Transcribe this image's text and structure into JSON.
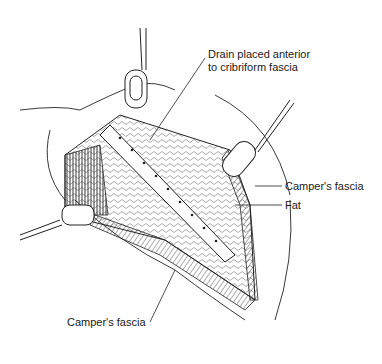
{
  "figure": {
    "labels": [
      {
        "id": "drain",
        "lines": [
          "Drain placed anterior",
          "to cribriform fascia"
        ]
      },
      {
        "id": "campers_right",
        "text": "Camper's fascia"
      },
      {
        "id": "fat",
        "text": "Fat"
      },
      {
        "id": "campers_bottom",
        "text": "Camper's fascia"
      }
    ],
    "colors": {
      "ink": "#1a1a1a",
      "background": "#ffffff"
    }
  }
}
